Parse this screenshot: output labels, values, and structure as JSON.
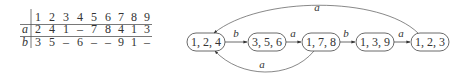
{
  "table": {
    "columns": [
      "1",
      "2",
      "3",
      "4",
      "5",
      "6",
      "7",
      "8",
      "9"
    ],
    "rows": [
      {
        "label": "a",
        "cells": [
          "2",
          "4",
          "1",
          "–",
          "7",
          "8",
          "4",
          "1",
          "3"
        ]
      },
      {
        "label": "b",
        "cells": [
          "3",
          "5",
          "–",
          "6",
          "–",
          "–",
          "9",
          "1",
          "–"
        ]
      }
    ]
  },
  "diagram": {
    "nodes": [
      {
        "id": "n124",
        "label": "1, 2, 4"
      },
      {
        "id": "n356",
        "label": "3, 5, 6"
      },
      {
        "id": "n178",
        "label": "1, 7, 8"
      },
      {
        "id": "n139",
        "label": "1, 3, 9"
      },
      {
        "id": "n123",
        "label": "1, 2, 3"
      }
    ],
    "edges": [
      {
        "from": "1, 2, 4",
        "to": "3, 5, 6",
        "label": "b"
      },
      {
        "from": "3, 5, 6",
        "to": "1, 7, 8",
        "label": "a"
      },
      {
        "from": "1, 7, 8",
        "to": "1, 3, 9",
        "label": "b"
      },
      {
        "from": "1, 3, 9",
        "to": "1, 2, 3",
        "label": "a"
      },
      {
        "from": "1, 2, 3",
        "to": "1, 2, 4",
        "label": "a"
      },
      {
        "from": "1, 7, 8",
        "to": "1, 2, 4",
        "label": "a"
      }
    ]
  }
}
